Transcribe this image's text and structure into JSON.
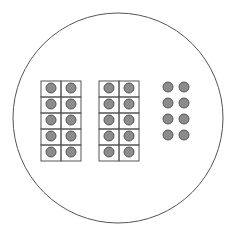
{
  "diagram": {
    "colors": {
      "outline": "#555555",
      "grid_line": "#555555",
      "counter_fill": "#8c8c8c",
      "counter_stroke": "#555555",
      "background": "#ffffff"
    },
    "enclosing_circle": {
      "cx": 118,
      "cy": 118,
      "r": 105
    },
    "ten_frames": [
      {
        "x": 41,
        "y": 81,
        "cols": 2,
        "rows": 5,
        "cell_w": 20,
        "cell_h": 16,
        "filled": 10
      },
      {
        "x": 99,
        "y": 81,
        "cols": 2,
        "rows": 5,
        "cell_w": 20,
        "cell_h": 16,
        "filled": 10
      }
    ],
    "loose_counters": {
      "cols_x": [
        168,
        184
      ],
      "rows_y": [
        87,
        103,
        119,
        135
      ],
      "count": 8
    },
    "counter_radius": 5,
    "total_count": 28
  }
}
